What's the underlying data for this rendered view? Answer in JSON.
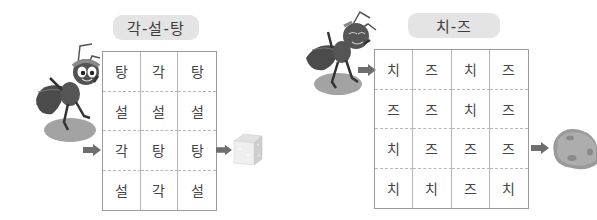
{
  "puzzles": [
    {
      "title": "각-설-탕",
      "columns": 3,
      "rows": [
        [
          "탕",
          "각",
          "탕"
        ],
        [
          "설",
          "설",
          "설"
        ],
        [
          "각",
          "탕",
          "탕"
        ],
        [
          "설",
          "각",
          "설"
        ]
      ],
      "start_icon": "ant-with-headband-icon",
      "goal_icon": "sugar-cube-icon"
    },
    {
      "title": "치-즈",
      "columns": 4,
      "rows": [
        [
          "치",
          "즈",
          "치",
          "즈"
        ],
        [
          "즈",
          "즈",
          "치",
          "즈"
        ],
        [
          "치",
          "즈",
          "즈",
          "즈"
        ],
        [
          "치",
          "치",
          "즈",
          "치"
        ]
      ],
      "start_icon": "ant-icon",
      "goal_icon": "cheese-icon"
    }
  ],
  "colors": {
    "pill_bg": "#e4e4e4",
    "grid_border": "#9a9a9a",
    "arrow": "#6e6e6e",
    "ant_body": "#4a4a4a",
    "shadow": "#9e9e9e"
  }
}
